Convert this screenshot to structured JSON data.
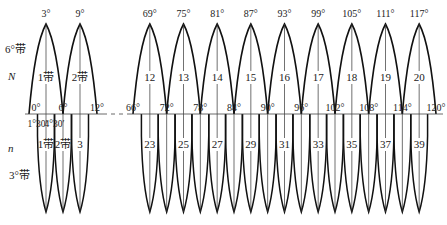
{
  "diagram": {
    "labels": {
      "six_deg_band": "6°带",
      "N": "N",
      "n": "n",
      "three_deg_band": "3°带"
    },
    "six_degree_zones": [
      {
        "center": "3°",
        "label": "1带",
        "center_deg": 3
      },
      {
        "center": "9°",
        "label": "2带",
        "center_deg": 9
      },
      {
        "center": "69°",
        "label": "12",
        "center_deg": 69
      },
      {
        "center": "75°",
        "label": "13",
        "center_deg": 75
      },
      {
        "center": "81°",
        "label": "14",
        "center_deg": 81
      },
      {
        "center": "87°",
        "label": "15",
        "center_deg": 87
      },
      {
        "center": "93°",
        "label": "16",
        "center_deg": 93
      },
      {
        "center": "99°",
        "label": "17",
        "center_deg": 99
      },
      {
        "center": "105°",
        "label": "18",
        "center_deg": 105
      },
      {
        "center": "111°",
        "label": "19",
        "center_deg": 111
      },
      {
        "center": "117°",
        "label": "20",
        "center_deg": 117
      }
    ],
    "boundary_ticks": [
      {
        "text": "0°",
        "deg": 0
      },
      {
        "text": "6°",
        "deg": 6
      },
      {
        "text": "12°",
        "deg": 12
      },
      {
        "text": "66°",
        "deg": 66
      },
      {
        "text": "72°",
        "deg": 72
      },
      {
        "text": "78°",
        "deg": 78
      },
      {
        "text": "84°",
        "deg": 84
      },
      {
        "text": "90°",
        "deg": 90
      },
      {
        "text": "96°",
        "deg": 96
      },
      {
        "text": "102°",
        "deg": 102
      },
      {
        "text": "108°",
        "deg": 108
      },
      {
        "text": "114°",
        "deg": 114
      },
      {
        "text": "120°",
        "deg": 120
      }
    ],
    "three_degree_sub_ticks": [
      {
        "text": "1°30′",
        "deg": 1.5
      },
      {
        "text": "4°30′",
        "deg": 4.5
      }
    ],
    "three_degree_zone_labels": [
      {
        "label": "1带",
        "deg": 3
      },
      {
        "label": "2带",
        "deg": 6
      },
      {
        "label": "3",
        "deg": 9
      },
      {
        "label": "23",
        "deg": 69
      },
      {
        "label": "25",
        "deg": 75
      },
      {
        "label": "27",
        "deg": 81
      },
      {
        "label": "29",
        "deg": 87
      },
      {
        "label": "31",
        "deg": 93
      },
      {
        "label": "33",
        "deg": 99
      },
      {
        "label": "35",
        "deg": 105
      },
      {
        "label": "37",
        "deg": 111
      },
      {
        "label": "39",
        "deg": 117
      }
    ]
  }
}
